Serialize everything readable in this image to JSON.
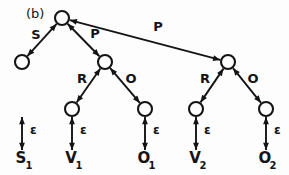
{
  "figure": {
    "panel_label": "(b)",
    "caption_position": "top-left",
    "background_color": "#fdfdfd",
    "ink_color": "#141414"
  },
  "graph": {
    "type": "parse-tree",
    "node_radius": 7,
    "nodes": [
      {
        "id": "root",
        "x": 62,
        "y": 18,
        "name": "root-node"
      },
      {
        "id": "n_s",
        "x": 22,
        "y": 62,
        "name": "s-node"
      },
      {
        "id": "n_p1",
        "x": 105,
        "y": 62,
        "name": "p1-node"
      },
      {
        "id": "n_p2",
        "x": 228,
        "y": 62,
        "name": "p2-node"
      },
      {
        "id": "n_r1",
        "x": 72,
        "y": 109,
        "name": "r1-node"
      },
      {
        "id": "n_o1",
        "x": 145,
        "y": 109,
        "name": "o1-node"
      },
      {
        "id": "n_r2",
        "x": 196,
        "y": 109,
        "name": "r2-node"
      },
      {
        "id": "n_o2",
        "x": 266,
        "y": 109,
        "name": "o2-node"
      }
    ],
    "edges": [
      {
        "from": "root",
        "to": "n_s",
        "label": "S",
        "label_x": 36,
        "label_y": 39,
        "double_headed": true,
        "name": "edge-s"
      },
      {
        "from": "root",
        "to": "n_p1",
        "label": "P",
        "label_x": 95,
        "label_y": 38,
        "double_headed": true,
        "name": "edge-p1"
      },
      {
        "from": "root",
        "to": "n_p2",
        "label": "P",
        "label_x": 158,
        "label_y": 31,
        "double_headed": true,
        "name": "edge-p2"
      },
      {
        "from": "n_p1",
        "to": "n_r1",
        "label": "R",
        "label_x": 82,
        "label_y": 83,
        "double_headed": true,
        "name": "edge-r1"
      },
      {
        "from": "n_p1",
        "to": "n_o1",
        "label": "O",
        "label_x": 131,
        "label_y": 83,
        "double_headed": true,
        "name": "edge-o1"
      },
      {
        "from": "n_p2",
        "to": "n_r2",
        "label": "R",
        "label_x": 205,
        "label_y": 83,
        "double_headed": true,
        "name": "edge-r2"
      },
      {
        "from": "n_p2",
        "to": "n_o2",
        "label": "O",
        "label_x": 253,
        "label_y": 83,
        "double_headed": true,
        "name": "edge-o2"
      }
    ],
    "terminals": [
      {
        "id": "t_s1",
        "from": "n_s",
        "x": 22,
        "label_base": "S",
        "label_sub": "1",
        "edge_label": "ε",
        "edge_label_x": 30,
        "edge_label_y": 134,
        "name": "terminal-s1"
      },
      {
        "id": "t_v1",
        "from": "n_r1",
        "x": 72,
        "label_base": "V",
        "label_sub": "1",
        "edge_label": "ε",
        "edge_label_x": 80,
        "edge_label_y": 134,
        "name": "terminal-v1"
      },
      {
        "id": "t_o1",
        "from": "n_o1",
        "x": 145,
        "label_base": "O",
        "label_sub": "1",
        "edge_label": "ε",
        "edge_label_x": 153,
        "edge_label_y": 134,
        "name": "terminal-o1"
      },
      {
        "id": "t_v2",
        "from": "n_r2",
        "x": 196,
        "label_base": "V",
        "label_sub": "2",
        "edge_label": "ε",
        "edge_label_x": 204,
        "edge_label_y": 134,
        "name": "terminal-v2"
      },
      {
        "id": "t_o2",
        "from": "n_o2",
        "x": 266,
        "label_base": "O",
        "label_sub": "2",
        "edge_label": "ε",
        "edge_label_x": 274,
        "edge_label_y": 134,
        "name": "terminal-o2"
      }
    ],
    "terminal_text_y": 163,
    "terminal_sub_y": 169,
    "terminal_arrow_top": 117,
    "terminal_arrow_bottom": 150
  }
}
